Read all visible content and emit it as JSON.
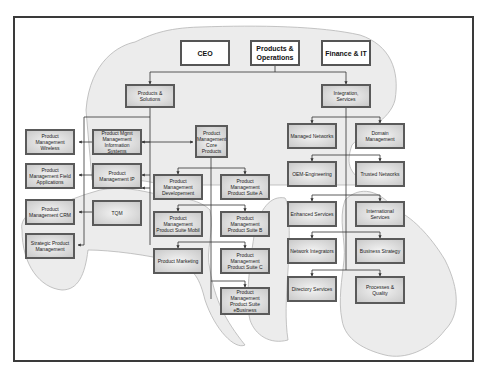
{
  "diagram": {
    "type": "organization-chart",
    "top_level": [
      {
        "id": "ceo",
        "label": "CEO"
      },
      {
        "id": "products_ops",
        "label": "Products & Operations"
      },
      {
        "id": "finance_it",
        "label": "Finance & IT"
      }
    ],
    "nodes": {
      "products_solutions": "Products & Solutions",
      "integration_services": "Integration, Services",
      "pm_wireless": "Product Management Wireless",
      "pm_field_apps": "Product Management Field Applications",
      "pm_crm": "Product Management CRM",
      "strategic_pm": "Strategic Product Management",
      "pm_mis": "Product Mgmt Management Information Systems",
      "pm_ip": "Product Management IP",
      "tqm": "TQM",
      "pm_core": "Product Management Core Products",
      "pm_development": "Product Management Developement",
      "pm_suite_a": "Product Management Product Suite A",
      "pm_suite_mobil": "Product Management Product Suite Mobil",
      "pm_suite_b": "Product Management Product Suite B",
      "product_marketing": "Product Marketing",
      "pm_suite_c": "Product Management Product Suite C",
      "pm_suite_ebusiness": "Product Management Product Suite eBusiness",
      "managed_networks": "Managed Networks",
      "domain_management": "Domain Management",
      "oem_engineering": "OEM-Engineering",
      "trusted_networks": "Trusted Networks",
      "enhanced_services": "Enhanced Services",
      "international_services": "International Services",
      "network_integrators": "Network Integrators",
      "business_strategy": "Business Strategy",
      "directory_services": "Directory Services",
      "processes_quality": "Processes & Quality"
    },
    "edges": [
      [
        "products_ops",
        "products_solutions"
      ],
      [
        "products_ops",
        "integration_services"
      ],
      [
        "products_solutions",
        "pm_mis"
      ],
      [
        "products_solutions",
        "pm_ip"
      ],
      [
        "products_solutions",
        "tqm"
      ],
      [
        "products_solutions",
        "strategic_pm"
      ],
      [
        "pm_mis",
        "pm_wireless"
      ],
      [
        "pm_mis",
        "pm_core"
      ],
      [
        "pm_ip",
        "pm_field_apps"
      ],
      [
        "tqm",
        "pm_crm"
      ],
      [
        "pm_core",
        "pm_development"
      ],
      [
        "pm_core",
        "pm_suite_a"
      ],
      [
        "pm_core",
        "pm_suite_mobil"
      ],
      [
        "pm_core",
        "pm_suite_b"
      ],
      [
        "pm_core",
        "product_marketing"
      ],
      [
        "pm_core",
        "pm_suite_c"
      ],
      [
        "pm_core",
        "pm_suite_ebusiness"
      ],
      [
        "integration_services",
        "managed_networks"
      ],
      [
        "integration_services",
        "domain_management"
      ],
      [
        "integration_services",
        "oem_engineering"
      ],
      [
        "integration_services",
        "trusted_networks"
      ],
      [
        "integration_services",
        "enhanced_services"
      ],
      [
        "integration_services",
        "international_services"
      ],
      [
        "integration_services",
        "network_integrators"
      ],
      [
        "integration_services",
        "business_strategy"
      ],
      [
        "integration_services",
        "directory_services"
      ],
      [
        "integration_services",
        "processes_quality"
      ]
    ],
    "colors": {
      "frame": "#3a3a3a",
      "box_border": "#5a5a5a",
      "box_fill_center": "#f4f4f4",
      "box_fill_edge": "#c9c9c9",
      "blob_fill": "#ececec",
      "blob_stroke": "#b5b5b5",
      "connector": "#333333"
    }
  }
}
